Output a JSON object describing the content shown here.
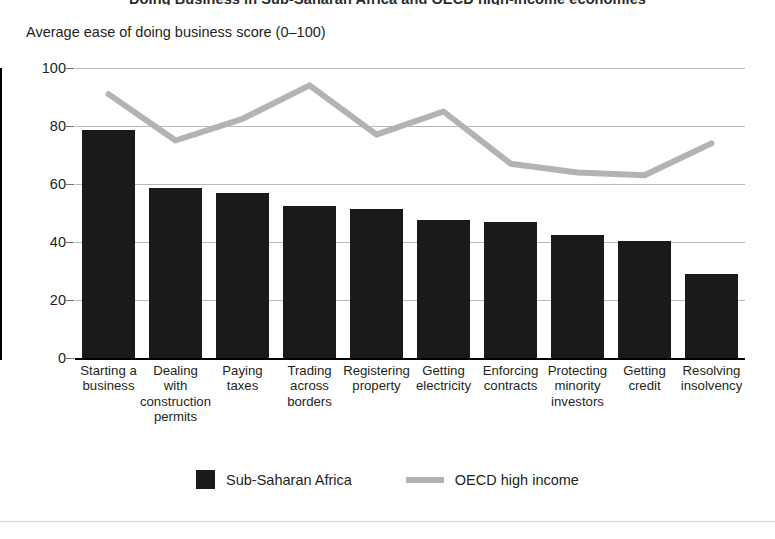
{
  "chart_data": {
    "type": "bar",
    "title": "Doing Business in Sub-Saharan Africa and OECD high-income economies",
    "subtitle": "",
    "ylabel": "Average ease of doing business score (0–100)",
    "xlabel": "",
    "ylim": [
      0,
      100
    ],
    "yticks": [
      0,
      20,
      40,
      60,
      80,
      100
    ],
    "ytick_labels": [
      "0",
      "20",
      "40",
      "60",
      "80",
      "100"
    ],
    "grid": true,
    "legend_position": "bottom",
    "categories": [
      "Starting a business",
      "Dealing with construction permits",
      "Paying taxes",
      "Trading across borders",
      "Registering property",
      "Getting electricity",
      "Enforcing contracts",
      "Protecting minority investors",
      "Getting credit",
      "Resolving insolvency"
    ],
    "category_lines": [
      [
        "Starting a",
        "business"
      ],
      [
        "Dealing",
        "with",
        "construction",
        "permits"
      ],
      [
        "Paying",
        "taxes"
      ],
      [
        "Trading",
        "across",
        "borders"
      ],
      [
        "Registering",
        "property"
      ],
      [
        "Getting",
        "electricity"
      ],
      [
        "Enforcing",
        "contracts"
      ],
      [
        "Protecting",
        "minority",
        "investors"
      ],
      [
        "Getting",
        "credit"
      ],
      [
        "Resolving",
        "insolvency"
      ]
    ],
    "series": [
      {
        "name": "Sub-Saharan Africa",
        "type": "bar",
        "color": "#1a1a1a",
        "values": [
          78.5,
          58.5,
          57.0,
          52.5,
          51.5,
          47.5,
          47.0,
          42.5,
          40.5,
          29.0
        ]
      },
      {
        "name": "OECD high income",
        "type": "line",
        "color": "#b3b3b3",
        "values": [
          91.0,
          75.0,
          82.5,
          94.0,
          77.0,
          85.0,
          67.0,
          64.0,
          63.0,
          74.0
        ]
      }
    ]
  },
  "axis": {
    "caption": "Average ease of doing business score (0–100)"
  },
  "legend": {
    "items": [
      {
        "label": "Sub-Saharan Africa",
        "marker": "square-swatch",
        "color": "#1a1a1a"
      },
      {
        "label": "OECD high income",
        "marker": "line-swatch",
        "color": "#b3b3b3"
      }
    ]
  }
}
